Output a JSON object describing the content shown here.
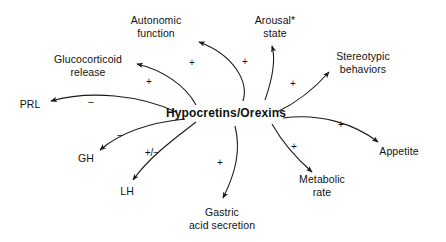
{
  "diagram": {
    "type": "radial-influence-diagram",
    "hub": {
      "id": "hub",
      "label": "Hypocretins/Orexins",
      "x": 226,
      "y": 113
    },
    "nodes": [
      {
        "id": "autonomic-function",
        "label": "Autonomic\nfunction",
        "x": 156,
        "y": 26
      },
      {
        "id": "arousal-state",
        "label": "Arousal*\nstate",
        "x": 275,
        "y": 26
      },
      {
        "id": "glucocorticoid",
        "label": "Glucocorticoid\nrelease",
        "x": 88,
        "y": 65
      },
      {
        "id": "stereotypic",
        "label": "Stereotypic\nbehaviors",
        "x": 363,
        "y": 62
      },
      {
        "id": "prl",
        "label": "PRL",
        "x": 30,
        "y": 104
      },
      {
        "id": "appetite",
        "label": "Appetite",
        "x": 399,
        "y": 151
      },
      {
        "id": "gh",
        "label": "GH",
        "x": 86,
        "y": 158
      },
      {
        "id": "metabolic-rate",
        "label": "Metabolic\nrate",
        "x": 322,
        "y": 185
      },
      {
        "id": "lh",
        "label": "LH",
        "x": 127,
        "y": 191
      },
      {
        "id": "gastric",
        "label": "Gastric\nacid secretion",
        "x": 222,
        "y": 218
      }
    ],
    "edges": [
      {
        "id": "hub-to-autonomic",
        "from": "hub",
        "to": "autonomic-function",
        "sign": "+",
        "sign_x": 192,
        "sign_y": 63
      },
      {
        "id": "hub-to-arousal",
        "from": "hub",
        "to": "arousal-state",
        "sign": "+",
        "sign_x": 245,
        "sign_y": 62
      },
      {
        "id": "hub-to-glucocorticoid",
        "from": "hub",
        "to": "glucocorticoid",
        "sign": "+",
        "sign_x": 149,
        "sign_y": 82
      },
      {
        "id": "hub-to-stereotypic",
        "from": "hub",
        "to": "stereotypic",
        "sign": "+",
        "sign_x": 293,
        "sign_y": 84
      },
      {
        "id": "hub-to-prl",
        "from": "hub",
        "to": "prl",
        "sign": "−",
        "sign_x": 91,
        "sign_y": 102
      },
      {
        "id": "hub-to-appetite",
        "from": "hub",
        "to": "appetite",
        "sign": "+",
        "sign_x": 341,
        "sign_y": 125
      },
      {
        "id": "hub-to-gh",
        "from": "hub",
        "to": "gh",
        "sign": "−",
        "sign_x": 120,
        "sign_y": 135
      },
      {
        "id": "hub-to-metabolic",
        "from": "hub",
        "to": "metabolic-rate",
        "sign": "+",
        "sign_x": 294,
        "sign_y": 147
      },
      {
        "id": "hub-to-lh",
        "from": "hub",
        "to": "lh",
        "sign": "+/−",
        "sign_x": 152,
        "sign_y": 153
      },
      {
        "id": "hub-to-gastric",
        "from": "hub",
        "to": "gastric",
        "sign": "+",
        "sign_x": 220,
        "sign_y": 163
      }
    ],
    "footnote_marker": "*",
    "colors": {
      "background": "#ffffff",
      "stroke": "#1a1a1a",
      "text": "#111111"
    }
  }
}
